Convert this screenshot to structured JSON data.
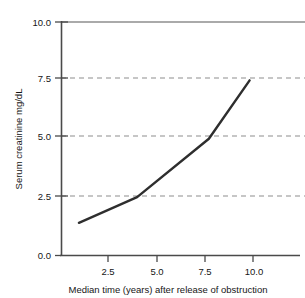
{
  "chart_data": {
    "type": "line",
    "title": "",
    "xlabel": "Median time (years) after release of obstruction",
    "ylabel": "Serum creatinine mg/dL",
    "xlim": [
      0,
      12.5
    ],
    "ylim": [
      0,
      10.0
    ],
    "grid": true,
    "grid_style": "horizontal dashed gray gridlines at 2.5, 5.0, 7.5; solid gray line at 10.0",
    "legend": "none",
    "xticks": [
      2.5,
      5.0,
      7.5,
      10.0
    ],
    "xtick_labels": [
      "2.5",
      "5.0",
      "7.5",
      "10.0"
    ],
    "yticks": [
      0.0,
      2.5,
      5.0,
      7.5,
      10.0
    ],
    "ytick_labels": [
      "0.0",
      "2.5",
      "5.0",
      "7.5",
      "10.0"
    ],
    "series": [
      {
        "name": "Serum creatinine",
        "x": [
          1.0,
          4.0,
          7.7,
          9.8
        ],
        "y": [
          1.4,
          2.5,
          5.0,
          7.5
        ]
      }
    ]
  },
  "axes": {
    "y_title": "Serum creatinine mg/dL",
    "x_title": "Median time (years) after release of obstruction",
    "y_tick_0": "0.0",
    "y_tick_1": "2.5",
    "y_tick_2": "5.0",
    "y_tick_3": "7.5",
    "y_tick_4": "10.0",
    "x_tick_0": "2.5",
    "x_tick_1": "5.0",
    "x_tick_2": "7.5",
    "x_tick_3": "10.0"
  },
  "colors": {
    "series_line": "#2e2e2e",
    "gridline": "#8e8e8e",
    "axis": "#4a4a4a",
    "background": "#ffffff",
    "text": "#161616"
  }
}
